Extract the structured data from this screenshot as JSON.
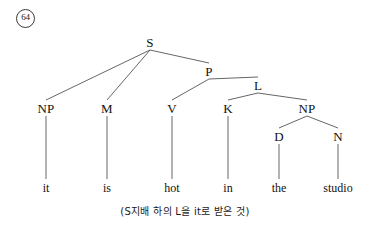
{
  "figure": {
    "example_number": "64",
    "caption": "(S지배 하의 L을 it로 받은 것)"
  },
  "diagram": {
    "type": "syntax-tree",
    "line_color": "#555555",
    "text_color": "#111111",
    "background": "#ffffff",
    "nodes": [
      {
        "id": "S",
        "label": "S",
        "x": 150,
        "y": 42,
        "level": 0
      },
      {
        "id": "P",
        "label": "P",
        "x": 209,
        "y": 71,
        "level": 1
      },
      {
        "id": "L",
        "label": "L",
        "x": 258,
        "y": 85,
        "level": 2
      },
      {
        "id": "NP1",
        "label": "NP",
        "x": 46,
        "y": 108,
        "level": 3
      },
      {
        "id": "M",
        "label": "M",
        "x": 107,
        "y": 108,
        "level": 3
      },
      {
        "id": "V",
        "label": "V",
        "x": 172,
        "y": 108,
        "level": 3
      },
      {
        "id": "K",
        "label": "K",
        "x": 228,
        "y": 108,
        "level": 3
      },
      {
        "id": "NP2",
        "label": "NP",
        "x": 307,
        "y": 108,
        "level": 3
      },
      {
        "id": "D",
        "label": "D",
        "x": 279,
        "y": 136,
        "level": 4
      },
      {
        "id": "N",
        "label": "N",
        "x": 338,
        "y": 136,
        "level": 4
      }
    ],
    "edges": [
      {
        "from": "S",
        "to": "NP1"
      },
      {
        "from": "S",
        "to": "M"
      },
      {
        "from": "S",
        "to": "P"
      },
      {
        "from": "P",
        "to": "V"
      },
      {
        "from": "P",
        "to": "L"
      },
      {
        "from": "L",
        "to": "K"
      },
      {
        "from": "L",
        "to": "NP2"
      },
      {
        "from": "NP2",
        "to": "D"
      },
      {
        "from": "NP2",
        "to": "N"
      }
    ],
    "leaves": [
      {
        "id": "leaf-it",
        "label": "it",
        "x": 46,
        "y": 188,
        "parent": "NP1"
      },
      {
        "id": "leaf-is",
        "label": "is",
        "x": 107,
        "y": 188,
        "parent": "M"
      },
      {
        "id": "leaf-hot",
        "label": "hot",
        "x": 172,
        "y": 188,
        "parent": "V"
      },
      {
        "id": "leaf-in",
        "label": "in",
        "x": 228,
        "y": 188,
        "parent": "K"
      },
      {
        "id": "leaf-the",
        "label": "the",
        "x": 279,
        "y": 188,
        "parent": "D"
      },
      {
        "id": "leaf-studio",
        "label": "studio",
        "x": 338,
        "y": 188,
        "parent": "N"
      }
    ],
    "leaf_stems": [
      {
        "x": 46,
        "y1": 116,
        "y2": 179
      },
      {
        "x": 107,
        "y1": 116,
        "y2": 179
      },
      {
        "x": 172,
        "y1": 116,
        "y2": 179
      },
      {
        "x": 228,
        "y1": 116,
        "y2": 179
      },
      {
        "x": 279,
        "y1": 144,
        "y2": 179
      },
      {
        "x": 338,
        "y1": 144,
        "y2": 179
      }
    ]
  }
}
